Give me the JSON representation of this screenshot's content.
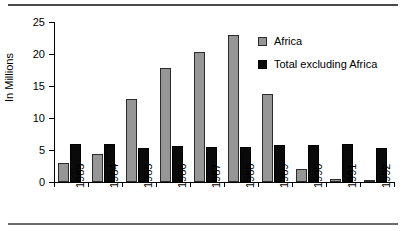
{
  "chart_data": {
    "type": "bar",
    "title": "",
    "subtitle": "",
    "xlabel": "",
    "ylabel": "In Millions",
    "ylim": [
      0,
      25
    ],
    "yticks": [
      0,
      5,
      10,
      15,
      20,
      25
    ],
    "grid": false,
    "legend_position": "inside-right",
    "categories": [
      "1983",
      "1984",
      "1985",
      "1986",
      "1987",
      "1988",
      "1989",
      "1990",
      "1991",
      "1992"
    ],
    "series": [
      {
        "name": "Africa",
        "color": "#969696",
        "values": [
          3.0,
          4.3,
          13.0,
          17.8,
          20.3,
          23.0,
          13.7,
          2.0,
          0.5,
          0.2
        ]
      },
      {
        "name": "Total excluding Africa",
        "color": "#0a0a0a",
        "values": [
          6.0,
          5.9,
          5.3,
          5.7,
          5.5,
          5.4,
          5.8,
          5.8,
          5.9,
          5.3
        ]
      }
    ]
  },
  "legend": {
    "items": [
      {
        "label": "Africa",
        "swatch": "africa"
      },
      {
        "label": "Total excluding Africa",
        "swatch": "total"
      }
    ]
  }
}
